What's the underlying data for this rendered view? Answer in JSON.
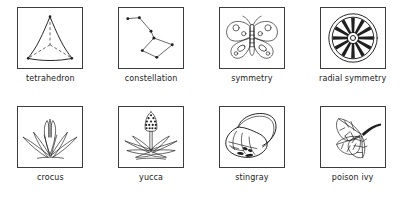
{
  "page": {
    "kind": "illustrated-vocabulary-card-grid",
    "background_color": "#ffffff",
    "ink_color": "#1f1f1f",
    "frame_border_color": "#3c3c3c",
    "columns": 4,
    "rows": 2
  },
  "cards": [
    {
      "caption": "tetrahedron",
      "icon": "tetrahedron-icon"
    },
    {
      "caption": "constellation",
      "icon": "constellation-icon"
    },
    {
      "caption": "symmetry",
      "icon": "butterfly-icon"
    },
    {
      "caption": "radial symmetry",
      "icon": "wagon-wheel-icon"
    },
    {
      "caption": "crocus",
      "icon": "crocus-icon"
    },
    {
      "caption": "yucca",
      "icon": "yucca-icon"
    },
    {
      "caption": "stingray",
      "icon": "stingray-icon"
    },
    {
      "caption": "poison ivy",
      "icon": "poison-ivy-icon"
    }
  ]
}
